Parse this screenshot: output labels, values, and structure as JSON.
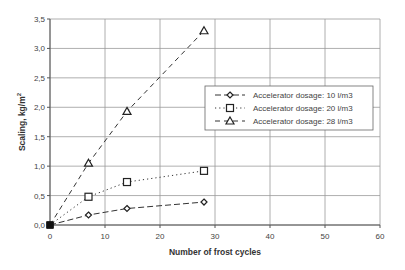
{
  "chart_data": {
    "type": "line",
    "title": "",
    "xlabel": "Number of frost cycles",
    "ylabel": "Scaling, kg/m",
    "ylabel_superscript": "2",
    "xlim": [
      0,
      60
    ],
    "ylim": [
      0,
      3.5
    ],
    "x_ticks": [
      0,
      10,
      20,
      30,
      40,
      50,
      60
    ],
    "x_tick_labels": [
      "0",
      "10",
      "20",
      "30",
      "40",
      "50",
      "60"
    ],
    "y_ticks": [
      0,
      0.5,
      1.0,
      1.5,
      2.0,
      2.5,
      3.0,
      3.5
    ],
    "y_tick_labels": [
      "0,0",
      "0,5",
      "1,0",
      "1,5",
      "2,0",
      "2,5",
      "3,0",
      "3,5"
    ],
    "grid": true,
    "legend_position": "right-middle inside plot",
    "series": [
      {
        "name": "Accelerator dosage: 10 l/m3",
        "marker": "diamond",
        "line_style": "long-dash",
        "x": [
          0,
          7,
          14,
          28
        ],
        "values": [
          0.0,
          0.17,
          0.28,
          0.39
        ]
      },
      {
        "name": "Accelerator dosage: 20 l/m3",
        "marker": "square",
        "line_style": "dotted",
        "x": [
          0,
          7,
          14,
          28
        ],
        "values": [
          0.0,
          0.48,
          0.73,
          0.92
        ]
      },
      {
        "name": "Accelerator dosage: 28 l/m3",
        "marker": "triangle",
        "line_style": "dash",
        "x": [
          0,
          7,
          14,
          28
        ],
        "values": [
          0.0,
          1.05,
          1.93,
          3.3
        ]
      }
    ]
  }
}
